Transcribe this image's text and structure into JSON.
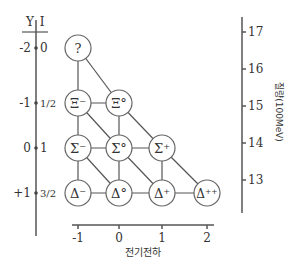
{
  "left_axis": {
    "header_y": "Y",
    "header_i": "I",
    "rows": [
      {
        "y": "-2",
        "i": "0"
      },
      {
        "y": "-1",
        "i": "1/2"
      },
      {
        "y": "0",
        "i": "1"
      },
      {
        "y": "+1",
        "i": "3/2"
      }
    ]
  },
  "bottom_axis": {
    "label": "전기전하",
    "ticks": [
      "-1",
      "0",
      "1",
      "2"
    ]
  },
  "right_axis": {
    "label": "질량(100MeV)",
    "ticks": [
      "17",
      "16",
      "15",
      "14",
      "13"
    ]
  },
  "nodes": [
    {
      "label": "?",
      "row": 0,
      "col": 0
    },
    {
      "label": "Ξ⁻",
      "row": 1,
      "col": 0
    },
    {
      "label": "Ξ°",
      "row": 1,
      "col": 1
    },
    {
      "label": "Σ⁻",
      "row": 2,
      "col": 0
    },
    {
      "label": "Σ°",
      "row": 2,
      "col": 1
    },
    {
      "label": "Σ⁺",
      "row": 2,
      "col": 2
    },
    {
      "label": "Δ⁻",
      "row": 3,
      "col": 0
    },
    {
      "label": "Δ°",
      "row": 3,
      "col": 1
    },
    {
      "label": "Δ⁺",
      "row": 3,
      "col": 2
    },
    {
      "label": "Δ⁺⁺",
      "row": 3,
      "col": 3
    }
  ]
}
